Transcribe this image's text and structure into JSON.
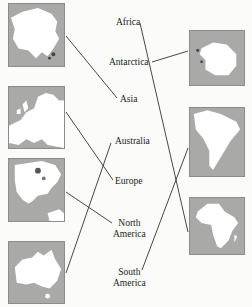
{
  "left_maps": [
    {
      "continent": "Asia",
      "icon": "asia-map-icon"
    },
    {
      "continent": "Europe",
      "icon": "europe-map-icon"
    },
    {
      "continent": "North America",
      "icon": "north-america-map-icon"
    },
    {
      "continent": "Australia",
      "icon": "australia-map-icon"
    }
  ],
  "right_maps": [
    {
      "continent": "Antarctica",
      "icon": "antarctica-map-icon"
    },
    {
      "continent": "South America",
      "icon": "south-america-map-icon"
    },
    {
      "continent": "Africa",
      "icon": "africa-map-icon"
    }
  ],
  "labels": {
    "africa": "Africa",
    "antarctica": "Antarctica",
    "asia": "Asia",
    "australia": "Australia",
    "europe": "Europe",
    "north_america_1": "North",
    "north_america_2": "America",
    "south_america_1": "South",
    "south_america_2": "America"
  },
  "matches": [
    {
      "map": "Asia",
      "label": "Asia"
    },
    {
      "map": "Europe",
      "label": "Europe"
    },
    {
      "map": "North America",
      "label": "North America"
    },
    {
      "map": "Australia",
      "label": "Australia"
    },
    {
      "map": "Antarctica",
      "label": "Antarctica"
    },
    {
      "map": "South America",
      "label": "South America"
    },
    {
      "map": "Africa",
      "label": "Africa"
    }
  ],
  "colors": {
    "map_ocean": "#a9a9a7",
    "land": "#ffffff",
    "line": "#333333"
  }
}
